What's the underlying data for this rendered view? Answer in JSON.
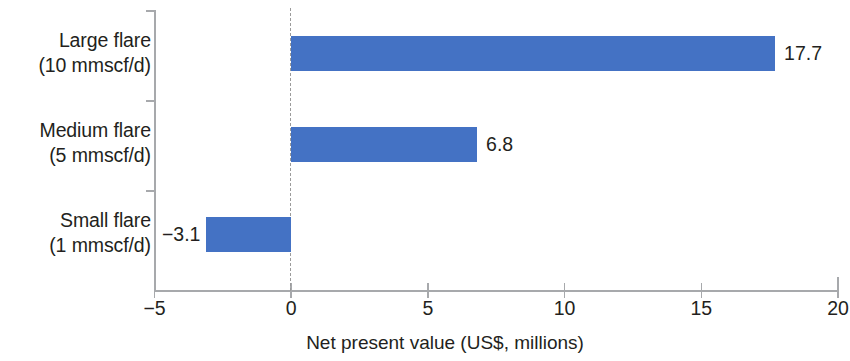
{
  "chart_data": {
    "type": "bar",
    "orientation": "horizontal",
    "title": "",
    "subtitle": "",
    "xlabel": "Net present value (US$, millions)",
    "ylabel": "",
    "categories": [
      "Large flare (10 mmscf/d)",
      "Medium flare (5 mmscf/d)",
      "Small flare (1 mmscf/d)"
    ],
    "category_lines": [
      {
        "line1": "Large flare",
        "line2": "(10 mmscf/d)"
      },
      {
        "line1": "Medium flare",
        "line2": "(5 mmscf/d)"
      },
      {
        "line1": "Small flare",
        "line2": "(1 mmscf/d)"
      }
    ],
    "values": [
      17.7,
      6.8,
      -3.1
    ],
    "value_labels": [
      "17.7",
      "6.8",
      "−3.1"
    ],
    "xlim": [
      -5,
      20
    ],
    "xticks": [
      -5,
      0,
      5,
      10,
      15,
      20
    ],
    "xtick_labels": [
      "−5",
      "0",
      "5",
      "10",
      "15",
      "20"
    ],
    "grid": false,
    "zero_reference_line": true,
    "legend": null,
    "bar_color": "#4472C4",
    "axis_color": "#a7a9ac",
    "zero_line_color": "#9b9b9b",
    "text_color": "#231f20",
    "background": "#ffffff"
  }
}
